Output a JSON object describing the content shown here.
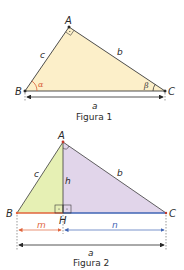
{
  "figure1": {
    "caption": "Figura 1",
    "vertices": {
      "A": "A",
      "B": "B",
      "C": "C"
    },
    "sides": {
      "a": "a",
      "b": "b",
      "c": "c"
    },
    "angles": {
      "alpha": "α",
      "beta": "β"
    },
    "colors": {
      "fill": "#fcefc9",
      "stroke": "#3a3a3a",
      "alpha": "#d9603a",
      "beta": "#3a3a3a"
    }
  },
  "figure2": {
    "caption": "Figura 2",
    "vertices": {
      "A": "A",
      "B": "B",
      "C": "C",
      "H": "H"
    },
    "sides": {
      "a": "a",
      "b": "b",
      "c": "c",
      "h": "h",
      "m": "m",
      "n": "n"
    },
    "colors": {
      "left_fill": "#e6f0b4",
      "right_fill": "#e1d5ea",
      "m_segment": "#e0643c",
      "n_segment": "#3f64b4",
      "stroke": "#3a3a3a"
    }
  }
}
